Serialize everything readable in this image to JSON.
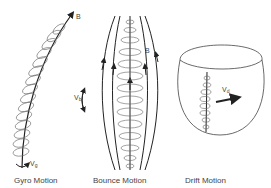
{
  "panels": [
    {
      "id": "gyro",
      "caption": "Gyro Motion",
      "field_label": "B",
      "velocity_label": "V",
      "velocity_sub": "g"
    },
    {
      "id": "bounce",
      "caption": "Bounce Motion",
      "field_label": "B",
      "velocity_label": "V",
      "velocity_sub": "b"
    },
    {
      "id": "drift",
      "caption": "Drift Motion",
      "velocity_label": "V",
      "velocity_sub": "d"
    }
  ],
  "colors": {
    "stroke": "#222222",
    "helix": "#555555",
    "text": "#444444"
  }
}
